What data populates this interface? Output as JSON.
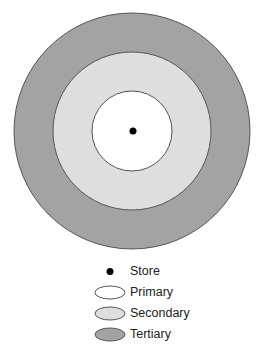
{
  "diagram": {
    "title": "",
    "zones": [
      {
        "name": "Tertiary",
        "radius": 118,
        "fill": "#a3a3a3"
      },
      {
        "name": "Secondary",
        "radius": 79,
        "fill": "#dedede"
      },
      {
        "name": "Primary",
        "radius": 40,
        "fill": "#ffffff"
      }
    ],
    "center": {
      "name": "Store",
      "radius": 3.5,
      "fill": "#000000"
    },
    "outline_color": "#555555"
  },
  "legend": {
    "items": [
      {
        "label": "Store",
        "type": "dot",
        "fill": "#000000"
      },
      {
        "label": "Primary",
        "type": "ellipse",
        "fill": "#ffffff"
      },
      {
        "label": "Secondary",
        "type": "ellipse",
        "fill": "#dedede"
      },
      {
        "label": "Tertiary",
        "type": "ellipse",
        "fill": "#a3a3a3"
      }
    ]
  }
}
